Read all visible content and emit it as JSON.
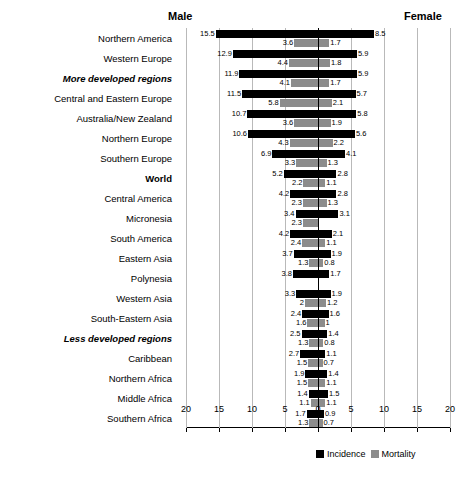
{
  "header": {
    "male_label": "Male",
    "female_label": "Female"
  },
  "legend": {
    "incidence_label": "Incidence",
    "mortality_label": "Mortality",
    "incidence_color": "#000000",
    "mortality_color": "#8c8c8c"
  },
  "axis": {
    "tick_labels": [
      "20",
      "15",
      "10",
      "5",
      "0",
      "5",
      "10",
      "15",
      "20"
    ],
    "max": 20
  },
  "chart_data": {
    "type": "bar",
    "orientation": "horizontal-diverging",
    "title": "",
    "subtitle": "",
    "xlabel": "",
    "ylabel": "",
    "xlim": [
      -20,
      20
    ],
    "grid": true,
    "legend_position": "bottom-right",
    "left_side": "Male",
    "right_side": "Female",
    "tick_labels": [
      "20",
      "15",
      "10",
      "5",
      "0",
      "5",
      "10",
      "15",
      "20"
    ],
    "tick_values": [
      -20,
      -15,
      -10,
      -5,
      0,
      5,
      10,
      15,
      20
    ],
    "series": [
      {
        "name": "Incidence",
        "color": "#000000"
      },
      {
        "name": "Mortality",
        "color": "#8c8c8c"
      }
    ],
    "categories": [
      "Northern America",
      "Western Europe",
      "More developed regions",
      "Central and Eastern Europe",
      "Australia/New Zealand",
      "Northern Europe",
      "Southern Europe",
      "World",
      "Central America",
      "Micronesia",
      "South America",
      "Eastern Asia",
      "Polynesia",
      "Western Asia",
      "South-Eastern Asia",
      "Less developed regions",
      "Caribbean",
      "Northern Africa",
      "Middle Africa",
      "Southern Africa"
    ],
    "rows": [
      {
        "region": "Northern America",
        "emphasis": "normal",
        "male_incidence": 15.5,
        "female_incidence": 8.5,
        "male_mortality": 3.6,
        "female_mortality": 1.7
      },
      {
        "region": "Western Europe",
        "emphasis": "normal",
        "male_incidence": 12.9,
        "female_incidence": 5.9,
        "male_mortality": 4.4,
        "female_mortality": 1.8
      },
      {
        "region": "More developed regions",
        "emphasis": "bolditalic",
        "male_incidence": 11.9,
        "female_incidence": 5.9,
        "male_mortality": 4.1,
        "female_mortality": 1.7
      },
      {
        "region": "Central and Eastern Europe",
        "emphasis": "normal",
        "male_incidence": 11.5,
        "female_incidence": 5.7,
        "male_mortality": 5.8,
        "female_mortality": 2.1
      },
      {
        "region": "Australia/New Zealand",
        "emphasis": "normal",
        "male_incidence": 10.7,
        "female_incidence": 5.8,
        "male_mortality": 3.6,
        "female_mortality": 1.9
      },
      {
        "region": "Northern Europe",
        "emphasis": "normal",
        "male_incidence": 10.6,
        "female_incidence": 5.6,
        "male_mortality": 4.3,
        "female_mortality": 2.2
      },
      {
        "region": "Southern Europe",
        "emphasis": "normal",
        "male_incidence": 6.9,
        "female_incidence": 4.1,
        "male_mortality": 3.3,
        "female_mortality": 1.3
      },
      {
        "region": "World",
        "emphasis": "bold",
        "male_incidence": 5.2,
        "female_incidence": 2.8,
        "male_mortality": 2.2,
        "female_mortality": 1.1
      },
      {
        "region": "Central America",
        "emphasis": "normal",
        "male_incidence": 4.2,
        "female_incidence": 2.8,
        "male_mortality": 2.3,
        "female_mortality": 1.3
      },
      {
        "region": "Micronesia",
        "emphasis": "normal",
        "male_incidence": 3.4,
        "female_incidence": 3.1,
        "male_mortality": 2.3,
        "female_mortality": null
      },
      {
        "region": "South America",
        "emphasis": "normal",
        "male_incidence": 4.2,
        "female_incidence": 2.1,
        "male_mortality": 2.4,
        "female_mortality": 1.1
      },
      {
        "region": "Eastern Asia",
        "emphasis": "normal",
        "male_incidence": 3.7,
        "female_incidence": 1.9,
        "male_mortality": 1.3,
        "female_mortality": 0.8
      },
      {
        "region": "Polynesia",
        "emphasis": "normal",
        "male_incidence": 3.8,
        "female_incidence": 1.7,
        "male_mortality": null,
        "female_mortality": null
      },
      {
        "region": "Western Asia",
        "emphasis": "normal",
        "male_incidence": 3.3,
        "female_incidence": 1.9,
        "male_mortality": 2.0,
        "female_mortality": 1.2
      },
      {
        "region": "South-Eastern Asia",
        "emphasis": "normal",
        "male_incidence": 2.4,
        "female_incidence": 1.6,
        "male_mortality": 1.6,
        "female_mortality": 1.0
      },
      {
        "region": "Less developed regions",
        "emphasis": "bolditalic",
        "male_incidence": 2.5,
        "female_incidence": 1.4,
        "male_mortality": 1.3,
        "female_mortality": 0.8
      },
      {
        "region": "Caribbean",
        "emphasis": "normal",
        "male_incidence": 2.7,
        "female_incidence": 1.1,
        "male_mortality": 1.5,
        "female_mortality": 0.7
      },
      {
        "region": "Northern Africa",
        "emphasis": "normal",
        "male_incidence": 1.9,
        "female_incidence": 1.4,
        "male_mortality": 1.5,
        "female_mortality": 1.1
      },
      {
        "region": "Middle Africa",
        "emphasis": "normal",
        "male_incidence": 1.4,
        "female_incidence": 1.5,
        "male_mortality": 1.1,
        "female_mortality": 1.1
      },
      {
        "region": "Southern Africa",
        "emphasis": "normal",
        "male_incidence": 1.7,
        "female_incidence": 0.9,
        "male_mortality": 1.3,
        "female_mortality": 0.7
      }
    ],
    "value_labels": {
      "male_incidence": [
        "15.5",
        "12.9",
        "11.9",
        "11.5",
        "10.7",
        "10.6",
        "6.9",
        "5.2",
        "4.2",
        "3.4",
        "4.2",
        "3.7",
        "3.8",
        "3.3",
        "2.4",
        "2.5",
        "2.7",
        "1.9",
        "1.4",
        "1.7"
      ],
      "female_incidence": [
        "8.5",
        "5.9",
        "5.9",
        "5.7",
        "5.8",
        "5.6",
        "4.1",
        "2.8",
        "2.8",
        "3.1",
        "2.1",
        "1.9",
        "1.7",
        "1.9",
        "1.6",
        "1.4",
        "1.1",
        "1.4",
        "1.5",
        "0.9"
      ],
      "male_mortality": [
        "3.6",
        "4.4",
        "4.1",
        "5.8",
        "3.6",
        "4.3",
        "3.3",
        "2.2",
        "2.3",
        "2.3",
        "2.4",
        "1.3",
        "",
        "2",
        "1.6",
        "1.3",
        "1.5",
        "1.5",
        "1.1",
        "1.3"
      ],
      "female_mortality": [
        "1.7",
        "1.8",
        "1.7",
        "2.1",
        "1.9",
        "2.2",
        "1.3",
        "1.1",
        "1.3",
        "",
        "1.1",
        "0.8",
        "",
        "1.2",
        "1",
        "0.8",
        "0.7",
        "1.1",
        "1.1",
        "0.7"
      ]
    }
  }
}
